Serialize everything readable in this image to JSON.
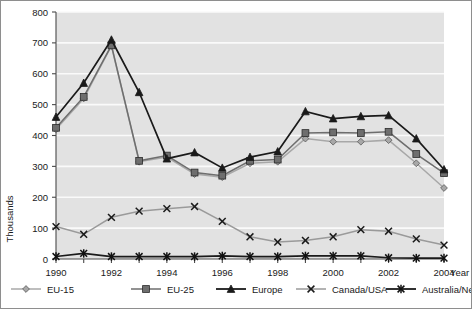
{
  "chart_data": {
    "type": "line",
    "title": "",
    "xlabel": "Year",
    "ylabel": "Thousands",
    "xlim": [
      1990,
      2004
    ],
    "ylim": [
      0,
      800
    ],
    "ytick_step": 100,
    "grid": "horizontal-white",
    "legend_position": "bottom",
    "x": [
      1990,
      1991,
      1992,
      1993,
      1994,
      1995,
      1996,
      1997,
      1998,
      1999,
      2000,
      2001,
      2002,
      2003,
      2004
    ],
    "xtick_labels": [
      "1990",
      "",
      "1992",
      "",
      "1994",
      "",
      "1996",
      "",
      "1998",
      "",
      "2000",
      "",
      "2002",
      "",
      "2004"
    ],
    "ytick_labels": [
      "0",
      "100",
      "200",
      "300",
      "400",
      "500",
      "600",
      "700",
      "800"
    ],
    "series": [
      {
        "name": "EU-15",
        "marker": "diamond",
        "color": "#a8a8a8",
        "values": [
          420,
          520,
          690,
          315,
          330,
          275,
          265,
          310,
          315,
          390,
          380,
          380,
          385,
          310,
          230
        ]
      },
      {
        "name": "EU-25",
        "marker": "square",
        "color": "#6e6e6e",
        "values": [
          425,
          525,
          692,
          318,
          335,
          280,
          270,
          318,
          322,
          408,
          410,
          408,
          412,
          340,
          278
        ]
      },
      {
        "name": "Europe",
        "marker": "triangle",
        "color": "#1a1a1a",
        "values": [
          460,
          570,
          710,
          540,
          325,
          345,
          295,
          330,
          348,
          478,
          455,
          462,
          465,
          390,
          290
        ]
      },
      {
        "name": "Canada/USA",
        "marker": "cross",
        "color": "#9a9a9a",
        "values": [
          105,
          80,
          135,
          155,
          163,
          170,
          122,
          72,
          55,
          60,
          72,
          95,
          90,
          65,
          45
        ]
      },
      {
        "name": "Australia/New Zealand",
        "marker": "asterisk",
        "color": "#1a1a1a",
        "values": [
          8,
          18,
          8,
          8,
          8,
          8,
          10,
          8,
          8,
          10,
          10,
          10,
          4,
          3,
          3
        ]
      }
    ]
  },
  "plot": {
    "background": "#e2e2e2",
    "gridline_color": "#fafafa",
    "axis_color": "#4a4a4a"
  }
}
